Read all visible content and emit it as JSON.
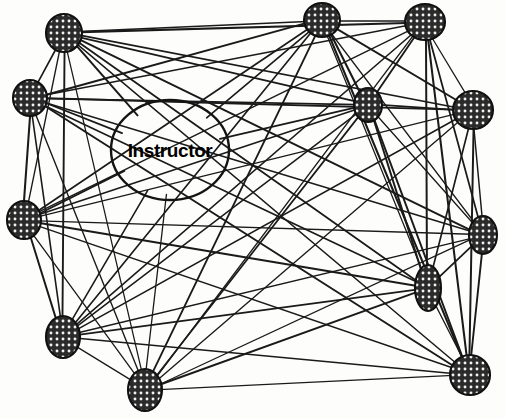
{
  "figure": {
    "type": "sociogram",
    "background_color": "#fdfdfc",
    "edge_color": "#1a1a1a",
    "node_fill_color": "#2b2b2b",
    "node_stroke_color": "#111111",
    "label_color": "#000000",
    "width": 505,
    "height": 419
  },
  "instructor": {
    "label": "Instructor",
    "cx": 170,
    "cy": 150,
    "rx": 59,
    "ry": 50,
    "filled": false
  },
  "nodes": [
    {
      "id": "n1",
      "cx": 64,
      "cy": 33,
      "rx": 18,
      "ry": 19,
      "rot": 0,
      "filled": true
    },
    {
      "id": "n2",
      "cx": 30,
      "cy": 98,
      "rx": 17,
      "ry": 18,
      "rot": 0,
      "filled": true
    },
    {
      "id": "n3",
      "cx": 322,
      "cy": 20,
      "rx": 18,
      "ry": 17,
      "rot": 0,
      "filled": true
    },
    {
      "id": "n4",
      "cx": 425,
      "cy": 22,
      "rx": 20,
      "ry": 18,
      "rot": 0,
      "filled": true
    },
    {
      "id": "n5",
      "cx": 368,
      "cy": 105,
      "rx": 14,
      "ry": 17,
      "rot": 0,
      "filled": true
    },
    {
      "id": "n6",
      "cx": 473,
      "cy": 110,
      "rx": 20,
      "ry": 19,
      "rot": 0,
      "filled": true
    },
    {
      "id": "n7",
      "cx": 24,
      "cy": 220,
      "rx": 17,
      "ry": 19,
      "rot": 0,
      "filled": true
    },
    {
      "id": "n8",
      "cx": 483,
      "cy": 235,
      "rx": 14,
      "ry": 19,
      "rot": 0,
      "filled": true
    },
    {
      "id": "n9",
      "cx": 428,
      "cy": 288,
      "rx": 13,
      "ry": 23,
      "rot": 0,
      "filled": true
    },
    {
      "id": "n10",
      "cx": 63,
      "cy": 337,
      "rx": 17,
      "ry": 21,
      "rot": 0,
      "filled": true
    },
    {
      "id": "n11",
      "cx": 145,
      "cy": 390,
      "rx": 17,
      "ry": 21,
      "rot": 0,
      "filled": true
    },
    {
      "id": "n12",
      "cx": 470,
      "cy": 375,
      "rx": 20,
      "ry": 20,
      "rot": 0,
      "filled": true
    }
  ],
  "edges": [
    [
      "n1",
      "n2"
    ],
    [
      "n1",
      "n3"
    ],
    [
      "n1",
      "n4"
    ],
    [
      "n1",
      "n5"
    ],
    [
      "n1",
      "n6"
    ],
    [
      "n1",
      "n7"
    ],
    [
      "n1",
      "n8"
    ],
    [
      "n1",
      "n9"
    ],
    [
      "n1",
      "n10"
    ],
    [
      "n1",
      "n11"
    ],
    [
      "n1",
      "n12"
    ],
    [
      "n1",
      "instructor"
    ],
    [
      "n2",
      "n3"
    ],
    [
      "n2",
      "n4"
    ],
    [
      "n2",
      "n5"
    ],
    [
      "n2",
      "n6"
    ],
    [
      "n2",
      "n7"
    ],
    [
      "n2",
      "n8"
    ],
    [
      "n2",
      "n9"
    ],
    [
      "n2",
      "n10"
    ],
    [
      "n2",
      "n11"
    ],
    [
      "n2",
      "n12"
    ],
    [
      "n3",
      "n4"
    ],
    [
      "n3",
      "n5"
    ],
    [
      "n3",
      "n6"
    ],
    [
      "n3",
      "n7"
    ],
    [
      "n3",
      "n8"
    ],
    [
      "n3",
      "n9"
    ],
    [
      "n3",
      "n10"
    ],
    [
      "n3",
      "n11"
    ],
    [
      "n3",
      "n12"
    ],
    [
      "n4",
      "n5"
    ],
    [
      "n4",
      "n6"
    ],
    [
      "n4",
      "n7"
    ],
    [
      "n4",
      "n8"
    ],
    [
      "n4",
      "n9"
    ],
    [
      "n4",
      "n10"
    ],
    [
      "n4",
      "n11"
    ],
    [
      "n4",
      "n12"
    ],
    [
      "n5",
      "n6"
    ],
    [
      "n5",
      "n7"
    ],
    [
      "n5",
      "n8"
    ],
    [
      "n5",
      "n9"
    ],
    [
      "n5",
      "n10"
    ],
    [
      "n5",
      "n11"
    ],
    [
      "n5",
      "n12"
    ],
    [
      "n6",
      "n7"
    ],
    [
      "n6",
      "n8"
    ],
    [
      "n6",
      "n9"
    ],
    [
      "n6",
      "n10"
    ],
    [
      "n6",
      "n11"
    ],
    [
      "n6",
      "n12"
    ],
    [
      "n7",
      "n8"
    ],
    [
      "n7",
      "n9"
    ],
    [
      "n7",
      "n10"
    ],
    [
      "n7",
      "n11"
    ],
    [
      "n7",
      "n12"
    ],
    [
      "n8",
      "n9"
    ],
    [
      "n8",
      "n10"
    ],
    [
      "n8",
      "n11"
    ],
    [
      "n8",
      "n12"
    ],
    [
      "n9",
      "n10"
    ],
    [
      "n9",
      "n11"
    ],
    [
      "n9",
      "n12"
    ],
    [
      "n10",
      "n11"
    ],
    [
      "n10",
      "n12"
    ],
    [
      "n11",
      "n12"
    ],
    [
      "n2",
      "instructor"
    ],
    [
      "n3",
      "instructor"
    ],
    [
      "n7",
      "instructor"
    ],
    [
      "n10",
      "instructor"
    ],
    [
      "n11",
      "instructor"
    ],
    [
      "n5",
      "instructor"
    ]
  ]
}
